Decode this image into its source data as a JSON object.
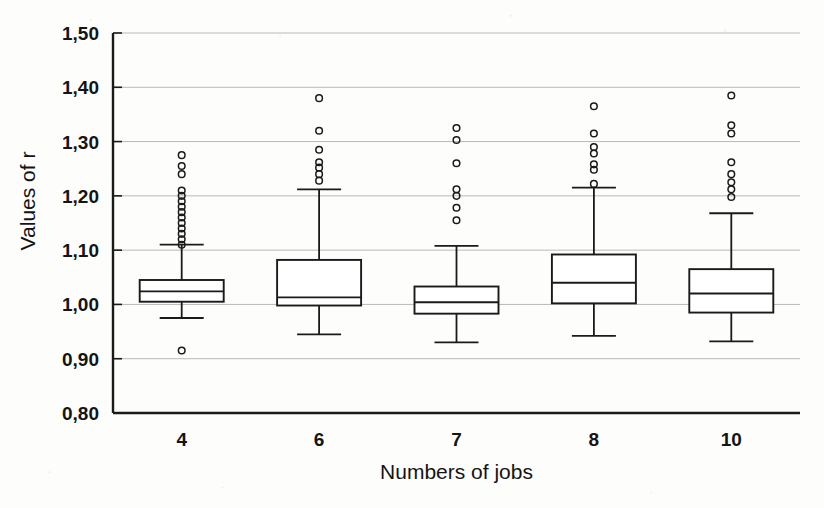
{
  "chart_data": {
    "type": "box",
    "title": "",
    "xlabel": "Numbers of jobs",
    "ylabel": "Values of r",
    "categories": [
      "4",
      "6",
      "7",
      "8",
      "10"
    ],
    "ylim": [
      0.8,
      1.5
    ],
    "ytick_values": [
      0.8,
      0.9,
      1.0,
      1.1,
      1.2,
      1.3,
      1.4,
      1.5
    ],
    "ytick_labels": [
      "0,80",
      "0,90",
      "1,00",
      "1,10",
      "1,20",
      "1,30",
      "1,40",
      "1,50"
    ],
    "decimal_separator": ",",
    "grid": "horizontal",
    "legend": "none",
    "boxes": [
      {
        "category": "4",
        "whisker_low": 0.975,
        "q1": 1.005,
        "median": 1.024,
        "q3": 1.045,
        "whisker_high": 1.11,
        "outliers": [
          0.915,
          1.11,
          1.12,
          1.13,
          1.14,
          1.15,
          1.16,
          1.17,
          1.18,
          1.19,
          1.2,
          1.21,
          1.24,
          1.255,
          1.275
        ]
      },
      {
        "category": "6",
        "whisker_low": 0.945,
        "q1": 0.998,
        "median": 1.013,
        "q3": 1.082,
        "whisker_high": 1.212,
        "outliers": [
          1.228,
          1.24,
          1.252,
          1.262,
          1.285,
          1.32,
          1.38
        ]
      },
      {
        "category": "7",
        "whisker_low": 0.93,
        "q1": 0.983,
        "median": 1.004,
        "q3": 1.033,
        "whisker_high": 1.108,
        "outliers": [
          1.155,
          1.178,
          1.2,
          1.212,
          1.26,
          1.303,
          1.325
        ]
      },
      {
        "category": "8",
        "whisker_low": 0.942,
        "q1": 1.002,
        "median": 1.04,
        "q3": 1.092,
        "whisker_high": 1.215,
        "outliers": [
          1.222,
          1.248,
          1.258,
          1.278,
          1.29,
          1.315,
          1.365
        ]
      },
      {
        "category": "10",
        "whisker_low": 0.932,
        "q1": 0.985,
        "median": 1.02,
        "q3": 1.065,
        "whisker_high": 1.168,
        "outliers": [
          1.198,
          1.212,
          1.225,
          1.24,
          1.262,
          1.315,
          1.33,
          1.385
        ]
      }
    ]
  },
  "axes": {
    "ylabel": "Values of r",
    "xlabel": "Numbers of jobs"
  }
}
